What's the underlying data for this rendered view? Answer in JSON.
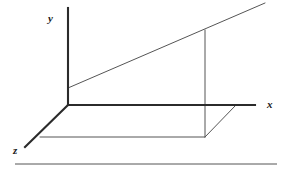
{
  "figure": {
    "kind": "3d-coordinate-axes-diagram",
    "width": 288,
    "height": 177,
    "background_color": "#ffffff",
    "stroke_color_axes": "#2b2b2b",
    "stroke_color_construction": "#555555",
    "stroke_color_rule": "#555555",
    "origin": {
      "x": 68,
      "y": 105
    },
    "axes": {
      "y_axis": {
        "label": "y",
        "label_x": 48,
        "label_y": 22,
        "x1": 68,
        "y1": 8,
        "x2": 68,
        "y2": 105,
        "stroke_width": 2.1
      },
      "x_axis": {
        "label": "x",
        "label_x": 267,
        "label_y": 108,
        "x1": 68,
        "y1": 105,
        "x2": 255,
        "y2": 105,
        "stroke_width": 2.1
      },
      "z_axis": {
        "label": "z",
        "label_x": 13,
        "label_y": 154,
        "x1": 68,
        "y1": 105,
        "x2": 25,
        "y2": 147,
        "stroke_width": 2.1
      }
    },
    "construction_lines": [
      {
        "name": "slanted-plane-edge",
        "x1": 68,
        "y1": 88,
        "x2": 265,
        "y2": 3,
        "stroke_width": 1.0
      },
      {
        "name": "vertical-drop-line",
        "x1": 205,
        "y1": 30,
        "x2": 205,
        "y2": 137,
        "stroke_width": 1.0
      },
      {
        "name": "base-horizontal-edge",
        "x1": 40,
        "y1": 137,
        "x2": 205,
        "y2": 137,
        "stroke_width": 1.0
      },
      {
        "name": "base-diagonal-edge",
        "x1": 205,
        "y1": 137,
        "x2": 236,
        "y2": 105,
        "stroke_width": 1.0
      }
    ],
    "footer_rule": {
      "x1": 15,
      "y1": 164,
      "x2": 277,
      "y2": 164,
      "stroke_width": 1.0
    }
  }
}
